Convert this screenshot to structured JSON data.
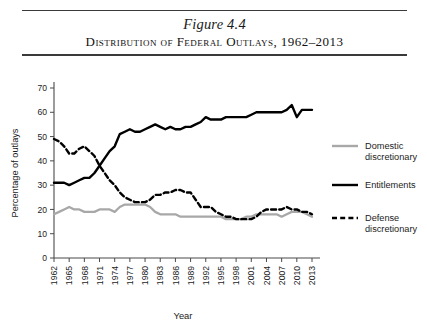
{
  "figure": {
    "number_label": "Figure 4.4",
    "title": "Distribution of Federal Outlays, 1962–2013"
  },
  "colors": {
    "entitlements": "#000000",
    "defense_discretionary": "#000000",
    "domestic_discretionary": "#a8a8a8",
    "axis": "#4a4a4a",
    "text": "#1c1c1c",
    "background": "#ffffff"
  },
  "legend": {
    "position": "right",
    "items": [
      {
        "label_line1": "Domestic",
        "label_line2": "discretionary",
        "style": "solid",
        "color": "#a8a8a8",
        "name": "domestic-discretionary"
      },
      {
        "label_line1": "Entitlements",
        "label_line2": "",
        "style": "solid",
        "color": "#000000",
        "name": "entitlements"
      },
      {
        "label_line1": "Defense",
        "label_line2": "discretionary",
        "style": "dashed",
        "color": "#000000",
        "name": "defense-discretionary"
      }
    ]
  },
  "chart_data": {
    "type": "line",
    "title": "Distribution of Federal Outlays, 1962–2013",
    "xlabel": "Year",
    "ylabel": "Percentage of outlays",
    "xlim": [
      1962,
      2013
    ],
    "ylim": [
      0,
      70
    ],
    "yticks": [
      0,
      10,
      20,
      30,
      40,
      50,
      60,
      70
    ],
    "xticks": [
      1962,
      1965,
      1968,
      1971,
      1974,
      1977,
      1980,
      1983,
      1986,
      1989,
      1992,
      1995,
      1998,
      2001,
      2004,
      2007,
      2010,
      2013
    ],
    "grid": false,
    "legend_position": "right",
    "x": [
      1962,
      1963,
      1964,
      1965,
      1966,
      1967,
      1968,
      1969,
      1970,
      1971,
      1972,
      1973,
      1974,
      1975,
      1976,
      1977,
      1978,
      1979,
      1980,
      1981,
      1982,
      1983,
      1984,
      1985,
      1986,
      1987,
      1988,
      1989,
      1990,
      1991,
      1992,
      1993,
      1994,
      1995,
      1996,
      1997,
      1998,
      1999,
      2000,
      2001,
      2002,
      2003,
      2004,
      2005,
      2006,
      2007,
      2008,
      2009,
      2010,
      2011,
      2012,
      2013
    ],
    "series": [
      {
        "name": "Defense discretionary",
        "style": "dashed",
        "color": "#000000",
        "values": [
          49,
          48,
          46,
          43,
          43,
          45,
          46,
          44,
          42,
          38,
          35,
          32,
          30,
          27,
          25,
          24,
          23,
          23,
          23,
          24,
          26,
          26,
          27,
          27,
          28,
          28,
          27,
          27,
          24,
          21,
          21,
          21,
          19,
          18,
          17,
          17,
          16,
          16,
          16,
          16,
          17,
          19,
          20,
          20,
          20,
          20,
          21,
          20,
          20,
          19,
          19,
          18
        ]
      },
      {
        "name": "Entitlements",
        "style": "solid",
        "color": "#000000",
        "values": [
          31,
          31,
          31,
          30,
          31,
          32,
          33,
          33,
          35,
          38,
          41,
          44,
          46,
          51,
          52,
          53,
          52,
          52,
          53,
          54,
          55,
          54,
          53,
          54,
          53,
          53,
          54,
          54,
          55,
          56,
          58,
          57,
          57,
          57,
          58,
          58,
          58,
          58,
          58,
          59,
          60,
          60,
          60,
          60,
          60,
          60,
          61,
          63,
          58,
          61,
          61,
          61
        ]
      },
      {
        "name": "Domestic discretionary",
        "style": "solid",
        "color": "#a8a8a8",
        "values": [
          18,
          19,
          20,
          21,
          20,
          20,
          19,
          19,
          19,
          20,
          20,
          20,
          19,
          21,
          22,
          22,
          22,
          22,
          22,
          21,
          19,
          18,
          18,
          18,
          18,
          17,
          17,
          17,
          17,
          17,
          17,
          17,
          17,
          17,
          16,
          16,
          16,
          16,
          17,
          17,
          18,
          18,
          18,
          18,
          18,
          17,
          18,
          19,
          19,
          19,
          18,
          17
        ]
      }
    ]
  },
  "axis": {
    "y_title": "Percentage of outlays",
    "x_title": "Year"
  }
}
